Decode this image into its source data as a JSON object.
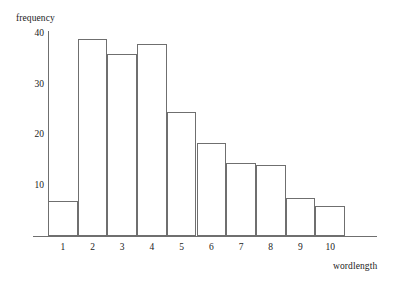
{
  "chart_data": {
    "type": "bar",
    "title": "",
    "xlabel": "wordlength",
    "ylabel": "frequency",
    "categories": [
      "1",
      "2",
      "3",
      "4",
      "5",
      "6",
      "7",
      "8",
      "9",
      "10"
    ],
    "values": [
      7,
      39,
      36,
      38,
      24.5,
      18.5,
      14.5,
      14,
      7.5,
      6
    ],
    "ylim": [
      0,
      40
    ],
    "yticks": [
      10,
      20,
      30,
      40
    ],
    "ytick_labels": [
      "10",
      "20",
      "30",
      "40"
    ],
    "xlim": [
      0.5,
      10.5
    ],
    "grid": false,
    "legend": null,
    "bar_style": {
      "fill": "none",
      "edge_color": "#6f6f6f",
      "edge_width": 1,
      "gap": 0
    },
    "axis_color": "#6f6f6f",
    "text_color": "#222222",
    "background": "#ffffff"
  }
}
